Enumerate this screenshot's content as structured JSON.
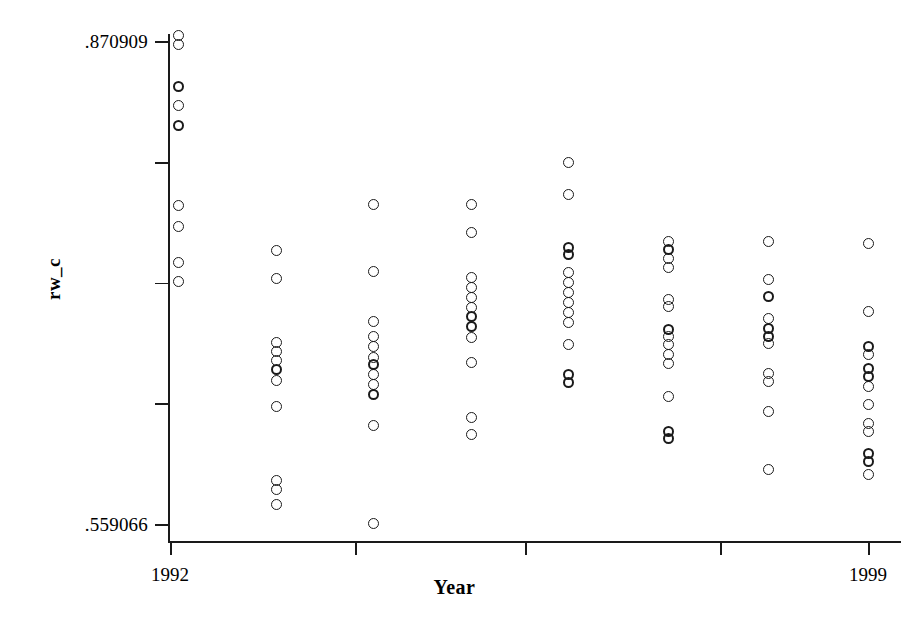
{
  "chart_data": {
    "type": "scatter",
    "title": "",
    "xlabel": "Year",
    "ylabel": "rw_c",
    "xlim": [
      1991.6,
      1999.4
    ],
    "ylim": [
      0.559066,
      0.870909
    ],
    "grid": false,
    "legend": null,
    "y_axis": {
      "min_label": ".559066",
      "max_label": ".870909",
      "min_value": 0.559066,
      "max_value": 0.870909,
      "tick_values": [
        0.559066,
        0.637027,
        0.714988,
        0.792948,
        0.870909
      ],
      "labeled_ticks": [
        ".559066",
        "",
        "",
        "",
        ".870909"
      ]
    },
    "x_axis": {
      "min_label": "1992",
      "max_label": "1999",
      "tick_values": [
        1992,
        1994,
        1996,
        1998,
        1999
      ],
      "labeled_ticks": [
        "1992",
        "",
        "",
        "",
        "1999"
      ]
    },
    "categories": [
      1992,
      1993,
      1994,
      1995,
      1996,
      1997,
      1998,
      1999
    ],
    "series": [
      {
        "name": "rw_c",
        "marker": "open-circle",
        "color": "#1a1a1a",
        "points": [
          {
            "x": 1992,
            "y": 0.8748,
            "bold": false
          },
          {
            "x": 1992,
            "y": 0.869,
            "bold": false
          },
          {
            "x": 1992,
            "y": 0.8425,
            "bold": true
          },
          {
            "x": 1992,
            "y": 0.8302,
            "bold": false
          },
          {
            "x": 1992,
            "y": 0.8172,
            "bold": true
          },
          {
            "x": 1992,
            "y": 0.7654,
            "bold": false
          },
          {
            "x": 1992,
            "y": 0.7518,
            "bold": false
          },
          {
            "x": 1992,
            "y": 0.7285,
            "bold": false
          },
          {
            "x": 1992,
            "y": 0.7162,
            "bold": false
          },
          {
            "x": 1993,
            "y": 0.7362,
            "bold": false
          },
          {
            "x": 1993,
            "y": 0.7181,
            "bold": false
          },
          {
            "x": 1993,
            "y": 0.6767,
            "bold": false
          },
          {
            "x": 1993,
            "y": 0.6709,
            "bold": false
          },
          {
            "x": 1993,
            "y": 0.6651,
            "bold": false
          },
          {
            "x": 1993,
            "y": 0.6593,
            "bold": true
          },
          {
            "x": 1993,
            "y": 0.6522,
            "bold": false
          },
          {
            "x": 1993,
            "y": 0.6354,
            "bold": false
          },
          {
            "x": 1993,
            "y": 0.5875,
            "bold": false
          },
          {
            "x": 1993,
            "y": 0.5823,
            "bold": false
          },
          {
            "x": 1993,
            "y": 0.5726,
            "bold": false
          },
          {
            "x": 1994,
            "y": 0.766,
            "bold": false
          },
          {
            "x": 1994,
            "y": 0.7227,
            "bold": false
          },
          {
            "x": 1994,
            "y": 0.6903,
            "bold": false
          },
          {
            "x": 1994,
            "y": 0.6806,
            "bold": false
          },
          {
            "x": 1994,
            "y": 0.6742,
            "bold": false
          },
          {
            "x": 1994,
            "y": 0.667,
            "bold": false
          },
          {
            "x": 1994,
            "y": 0.6625,
            "bold": true
          },
          {
            "x": 1994,
            "y": 0.656,
            "bold": false
          },
          {
            "x": 1994,
            "y": 0.6496,
            "bold": false
          },
          {
            "x": 1994,
            "y": 0.6431,
            "bold": true
          },
          {
            "x": 1994,
            "y": 0.623,
            "bold": false
          },
          {
            "x": 1994,
            "y": 0.5603,
            "bold": false
          },
          {
            "x": 1995,
            "y": 0.766,
            "bold": false
          },
          {
            "x": 1995,
            "y": 0.7479,
            "bold": false
          },
          {
            "x": 1995,
            "y": 0.7188,
            "bold": false
          },
          {
            "x": 1995,
            "y": 0.7123,
            "bold": false
          },
          {
            "x": 1995,
            "y": 0.7059,
            "bold": false
          },
          {
            "x": 1995,
            "y": 0.6994,
            "bold": false
          },
          {
            "x": 1995,
            "y": 0.6936,
            "bold": true
          },
          {
            "x": 1995,
            "y": 0.6871,
            "bold": true
          },
          {
            "x": 1995,
            "y": 0.68,
            "bold": false
          },
          {
            "x": 1995,
            "y": 0.6638,
            "bold": false
          },
          {
            "x": 1995,
            "y": 0.6282,
            "bold": false
          },
          {
            "x": 1995,
            "y": 0.6172,
            "bold": false
          },
          {
            "x": 1996,
            "y": 0.7932,
            "bold": false
          },
          {
            "x": 1996,
            "y": 0.7725,
            "bold": false
          },
          {
            "x": 1996,
            "y": 0.7382,
            "bold": true
          },
          {
            "x": 1996,
            "y": 0.7337,
            "bold": true
          },
          {
            "x": 1996,
            "y": 0.7221,
            "bold": false
          },
          {
            "x": 1996,
            "y": 0.7156,
            "bold": false
          },
          {
            "x": 1996,
            "y": 0.7092,
            "bold": false
          },
          {
            "x": 1996,
            "y": 0.7027,
            "bold": false
          },
          {
            "x": 1996,
            "y": 0.6962,
            "bold": false
          },
          {
            "x": 1996,
            "y": 0.6898,
            "bold": false
          },
          {
            "x": 1996,
            "y": 0.6755,
            "bold": false
          },
          {
            "x": 1996,
            "y": 0.6561,
            "bold": true
          },
          {
            "x": 1996,
            "y": 0.6509,
            "bold": true
          },
          {
            "x": 1997,
            "y": 0.7421,
            "bold": false
          },
          {
            "x": 1997,
            "y": 0.7369,
            "bold": true
          },
          {
            "x": 1997,
            "y": 0.7311,
            "bold": false
          },
          {
            "x": 1997,
            "y": 0.7253,
            "bold": false
          },
          {
            "x": 1997,
            "y": 0.7046,
            "bold": false
          },
          {
            "x": 1997,
            "y": 0.7001,
            "bold": false
          },
          {
            "x": 1997,
            "y": 0.6852,
            "bold": true
          },
          {
            "x": 1997,
            "y": 0.6806,
            "bold": false
          },
          {
            "x": 1997,
            "y": 0.6755,
            "bold": false
          },
          {
            "x": 1997,
            "y": 0.669,
            "bold": false
          },
          {
            "x": 1997,
            "y": 0.6632,
            "bold": false
          },
          {
            "x": 1997,
            "y": 0.6418,
            "bold": false
          },
          {
            "x": 1997,
            "y": 0.6192,
            "bold": true
          },
          {
            "x": 1997,
            "y": 0.6147,
            "bold": true
          },
          {
            "x": 1998,
            "y": 0.7421,
            "bold": false
          },
          {
            "x": 1998,
            "y": 0.7175,
            "bold": false
          },
          {
            "x": 1998,
            "y": 0.7065,
            "bold": true
          },
          {
            "x": 1998,
            "y": 0.6923,
            "bold": false
          },
          {
            "x": 1998,
            "y": 0.6858,
            "bold": true
          },
          {
            "x": 1998,
            "y": 0.6806,
            "bold": true
          },
          {
            "x": 1998,
            "y": 0.6761,
            "bold": false
          },
          {
            "x": 1998,
            "y": 0.6567,
            "bold": false
          },
          {
            "x": 1998,
            "y": 0.6515,
            "bold": false
          },
          {
            "x": 1998,
            "y": 0.6321,
            "bold": false
          },
          {
            "x": 1998,
            "y": 0.5952,
            "bold": false
          },
          {
            "x": 1999,
            "y": 0.7408,
            "bold": false
          },
          {
            "x": 1999,
            "y": 0.6968,
            "bold": false
          },
          {
            "x": 1999,
            "y": 0.6742,
            "bold": true
          },
          {
            "x": 1999,
            "y": 0.669,
            "bold": false
          },
          {
            "x": 1999,
            "y": 0.6599,
            "bold": true
          },
          {
            "x": 1999,
            "y": 0.6548,
            "bold": true
          },
          {
            "x": 1999,
            "y": 0.6483,
            "bold": false
          },
          {
            "x": 1999,
            "y": 0.6367,
            "bold": false
          },
          {
            "x": 1999,
            "y": 0.6243,
            "bold": false
          },
          {
            "x": 1999,
            "y": 0.6192,
            "bold": false
          },
          {
            "x": 1999,
            "y": 0.605,
            "bold": true
          },
          {
            "x": 1999,
            "y": 0.5998,
            "bold": true
          },
          {
            "x": 1999,
            "y": 0.5914,
            "bold": false
          }
        ]
      }
    ]
  }
}
